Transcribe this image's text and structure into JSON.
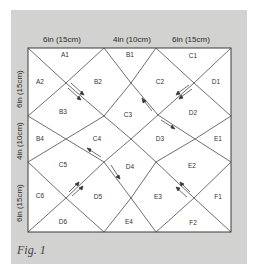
{
  "figure": {
    "caption": "Fig. 1",
    "top_dimensions": [
      "6in (15cm)",
      "4in (10cm)",
      "6in (15cm)"
    ],
    "left_dimensions": [
      "6in (15cm)",
      "4in (10cm)",
      "6in (15cm)"
    ],
    "pieces": [
      {
        "id": "A1",
        "x": 65,
        "y": 55
      },
      {
        "id": "A2",
        "x": 40,
        "y": 82
      },
      {
        "id": "B1",
        "x": 130,
        "y": 55
      },
      {
        "id": "B2",
        "x": 98,
        "y": 82
      },
      {
        "id": "B3",
        "x": 63,
        "y": 112
      },
      {
        "id": "B4",
        "x": 40,
        "y": 139
      },
      {
        "id": "C1",
        "x": 193,
        "y": 56
      },
      {
        "id": "C2",
        "x": 160,
        "y": 82
      },
      {
        "id": "C3",
        "x": 128,
        "y": 115
      },
      {
        "id": "C4",
        "x": 97,
        "y": 139
      },
      {
        "id": "C5",
        "x": 63,
        "y": 165
      },
      {
        "id": "C6",
        "x": 40,
        "y": 196
      },
      {
        "id": "D1",
        "x": 216,
        "y": 82
      },
      {
        "id": "D2",
        "x": 193,
        "y": 113
      },
      {
        "id": "D3",
        "x": 160,
        "y": 139
      },
      {
        "id": "D4",
        "x": 130,
        "y": 167
      },
      {
        "id": "D5",
        "x": 98,
        "y": 197
      },
      {
        "id": "D6",
        "x": 63,
        "y": 222
      },
      {
        "id": "E1",
        "x": 218,
        "y": 139
      },
      {
        "id": "E2",
        "x": 192,
        "y": 166
      },
      {
        "id": "E3",
        "x": 158,
        "y": 197
      },
      {
        "id": "E4",
        "x": 129,
        "y": 222
      },
      {
        "id": "F1",
        "x": 218,
        "y": 197
      },
      {
        "id": "F2",
        "x": 193,
        "y": 223
      }
    ]
  }
}
